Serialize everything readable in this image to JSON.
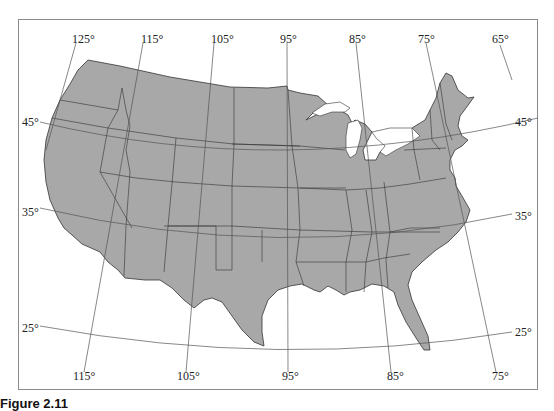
{
  "figure": {
    "caption": "Figure 2.11",
    "type": "map",
    "colors": {
      "land": "#a8a8a8",
      "state_border": "#333333",
      "graticule": "#555555",
      "frame": "#8a8a8a",
      "background": "#ffffff"
    }
  },
  "graticule": {
    "longitude_labels_top": [
      "125°",
      "115°",
      "105°",
      "95°",
      "85°",
      "75°",
      "65°"
    ],
    "longitude_labels_bottom": [
      "115°",
      "105°",
      "95°",
      "85°",
      "75°"
    ],
    "latitude_labels_left": [
      "45°",
      "35°",
      "25°"
    ],
    "latitude_labels_right": [
      "45°",
      "35°",
      "25°"
    ]
  }
}
